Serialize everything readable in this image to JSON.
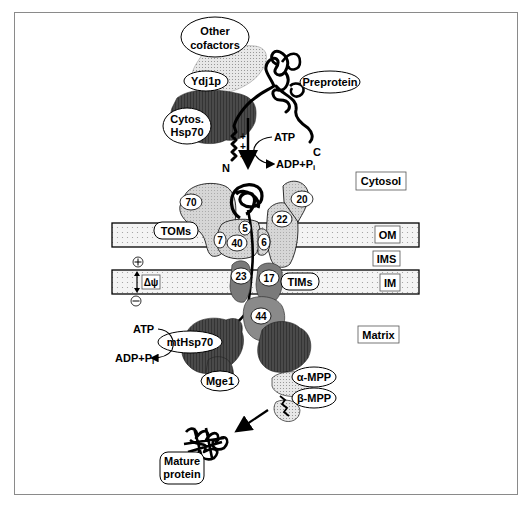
{
  "figure": {
    "compartments": {
      "cytosol": "Cytosol",
      "outer_membrane": "OM",
      "intermembrane_space": "IMS",
      "inner_membrane": "IM",
      "matrix": "Matrix"
    },
    "cytosolic_factors": {
      "other_cofactors_line1": "Other",
      "other_cofactors_line2": "cofactors",
      "ydj1p": "Ydj1p",
      "cytos_hsp70_line1": "Cytos.",
      "cytos_hsp70_line2": "Hsp70",
      "preprotein": "Preprotein",
      "c_terminus": "C",
      "n_terminus": "N",
      "positive_charges": "+ + +"
    },
    "energy": {
      "atp_top": "ATP",
      "adp_top": "ADP+P",
      "adp_top_sub": "i",
      "atp_matrix": "ATP",
      "adp_matrix": "ADP+P",
      "adp_matrix_sub": "i"
    },
    "tom_complex": {
      "label": "TOMs",
      "subunits": [
        "70",
        "20",
        "22",
        "5",
        "7",
        "40",
        "6"
      ]
    },
    "tim_complex": {
      "label": "TIMs",
      "subunits": [
        "23",
        "17",
        "44"
      ]
    },
    "membrane_potential": {
      "label": "Δψ",
      "plus": "+",
      "minus": "−"
    },
    "matrix_factors": {
      "mthsp70": "mtHsp70",
      "mge1": "Mge1",
      "alpha_mpp": "α-MPP",
      "beta_mpp": "β-MPP",
      "mature_line1": "Mature",
      "mature_line2": "protein"
    }
  }
}
